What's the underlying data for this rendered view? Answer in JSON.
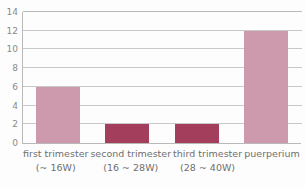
{
  "chart_data": {
    "type": "bar",
    "title": "",
    "subtitle": "",
    "xlabel": "",
    "ylabel": "",
    "ylim": [
      0,
      14
    ],
    "ytick_step": 2,
    "yticks": [
      "14",
      "12",
      "10",
      "8",
      "6",
      "4",
      "2",
      "0"
    ],
    "grid": true,
    "legend": false,
    "categories": [
      "first trimester (~ 16W)",
      "second trimester (16 ~ 28W)",
      "third trimester (28 ~ 40W)",
      "puerperium"
    ],
    "values": [
      6,
      2,
      2,
      12
    ],
    "bars": [
      {
        "label_line1": "first trimester",
        "label_line2": "(~ 16W)",
        "value": 6,
        "color": "#cc9aac"
      },
      {
        "label_line1": "second trimester",
        "label_line2": "(16 ~ 28W)",
        "value": 2,
        "color": "#a33e5c"
      },
      {
        "label_line1": "third trimester",
        "label_line2": "(28 ~ 40W)",
        "value": 2,
        "color": "#a33e5c"
      },
      {
        "label_line1": "puerperium",
        "label_line2": "",
        "value": 12,
        "color": "#cc9aac"
      }
    ],
    "colors": {
      "bar_light": "#cc9aac",
      "bar_dark": "#a33e5c",
      "gridline": "#c9c9c9",
      "axis": "#b9b9b9",
      "tick_text": "#8a8a8a",
      "label_text": "#6f6f6f",
      "background": "#fdfdfd"
    }
  }
}
